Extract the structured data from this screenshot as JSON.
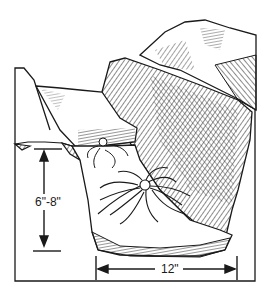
{
  "diagram": {
    "dimensions": {
      "depth_label": "6\"-8\"",
      "width_label": "12\""
    },
    "colors": {
      "ink": "#1a1a1a",
      "background": "#ffffff"
    }
  }
}
